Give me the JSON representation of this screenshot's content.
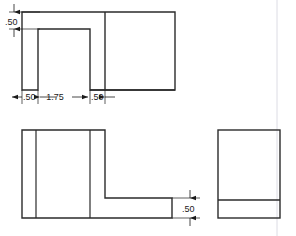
{
  "drawing": {
    "title": "Three-view orthographic drawing of L-bracket with slot",
    "units": "inches",
    "line_color": "#2b2b2b",
    "dim_line_color": "#1a1a1a",
    "construction_line_color": "#d8d8e0",
    "background_color": "#ffffff",
    "views": {
      "top": {
        "name": "top-view",
        "outline": "U-shaped plate with rectangular slot open at bottom",
        "outer": {
          "x": 22,
          "y": 12,
          "width": 153,
          "height": 78
        },
        "slot": {
          "x": 38,
          "y": 29,
          "width": 52,
          "height": 61
        },
        "edge_line_x": 105
      },
      "front": {
        "name": "front-view",
        "outline": "L-shaped bracket profile",
        "back_plate": {
          "x": 22,
          "y": 130,
          "width": 83,
          "height": 88
        },
        "flange": {
          "x": 105,
          "y": 198,
          "width": 67,
          "height": 20
        },
        "edge_line_1_x": 36,
        "edge_line_2_x": 90
      },
      "right": {
        "name": "right-side-view",
        "outline": "Rectangle with base flange line",
        "outer": {
          "x": 218,
          "y": 130,
          "width": 62,
          "height": 88
        },
        "flange_line_y": 200
      }
    },
    "construction_line": {
      "x": 277,
      "y1": 0,
      "y2": 236
    },
    "dimensions": [
      {
        "id": "top-thickness",
        "label": ".50",
        "orientation": "vertical",
        "view": "top-view",
        "text_x": 18,
        "text_y": 25,
        "dim_line_x": 9,
        "y_start": 12,
        "y_end": 29,
        "ext_line_from_x": 9,
        "ext_line_to_x": 40
      },
      {
        "id": "top-left-wall",
        "label": ".50",
        "orientation": "horizontal",
        "view": "top-view",
        "text_x": 30,
        "text_y": 100,
        "dim_line_y": 97,
        "x_start": 22,
        "x_end": 38
      },
      {
        "id": "top-slot-width",
        "label": "1.75",
        "orientation": "horizontal",
        "view": "top-view",
        "text_x": 64,
        "text_y": 100,
        "dim_line_y": 97,
        "x_start": 38,
        "x_end": 90
      },
      {
        "id": "top-right-wall",
        "label": ".50",
        "orientation": "horizontal",
        "view": "top-view",
        "text_x": 97,
        "text_y": 100,
        "dim_line_y": 97,
        "x_start": 90,
        "x_end": 105
      },
      {
        "id": "front-flange-thickness",
        "label": ".50",
        "orientation": "vertical",
        "view": "front-view",
        "text_x": 194,
        "text_y": 212,
        "dim_line_x": 190,
        "y_start": 198,
        "y_end": 218
      }
    ]
  },
  "labels": {
    "top_thickness": ".50",
    "top_left_wall": ".50",
    "top_slot_width": "1.75",
    "top_right_wall": ".50",
    "front_flange_thickness": ".50"
  }
}
